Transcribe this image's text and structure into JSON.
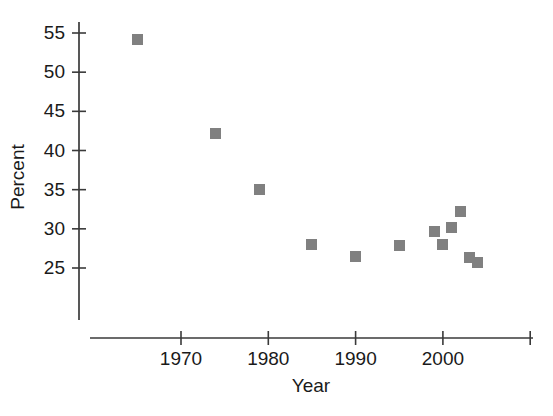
{
  "chart_data": {
    "type": "scatter",
    "title": "",
    "xlabel": "Year",
    "ylabel": "Percent",
    "xlim": [
      1962,
      2011
    ],
    "ylim": [
      21.5,
      56.5
    ],
    "xticks": [
      1970,
      1980,
      1990,
      2000,
      2010
    ],
    "xtick_labels": [
      "1970",
      "1980",
      "1990",
      "2000",
      ""
    ],
    "yticks": [
      25,
      30,
      35,
      40,
      45,
      50,
      55
    ],
    "ytick_labels": [
      "25",
      "30",
      "35",
      "40",
      "45",
      "50",
      "55"
    ],
    "grid": false,
    "legend": null,
    "marker_shape": "square",
    "marker_color": "#808080",
    "axis_color": "#3a3a3a",
    "series": [
      {
        "name": "Percent",
        "points": [
          {
            "x": 1965,
            "y": 54.2
          },
          {
            "x": 1974,
            "y": 42.2
          },
          {
            "x": 1979,
            "y": 35.0
          },
          {
            "x": 1985,
            "y": 28.0
          },
          {
            "x": 1990,
            "y": 26.5
          },
          {
            "x": 1995,
            "y": 27.9
          },
          {
            "x": 1999,
            "y": 29.6
          },
          {
            "x": 2000,
            "y": 28.0
          },
          {
            "x": 2001,
            "y": 30.2
          },
          {
            "x": 2002,
            "y": 32.2
          },
          {
            "x": 2003,
            "y": 26.3
          },
          {
            "x": 2004,
            "y": 25.7
          }
        ]
      }
    ]
  }
}
